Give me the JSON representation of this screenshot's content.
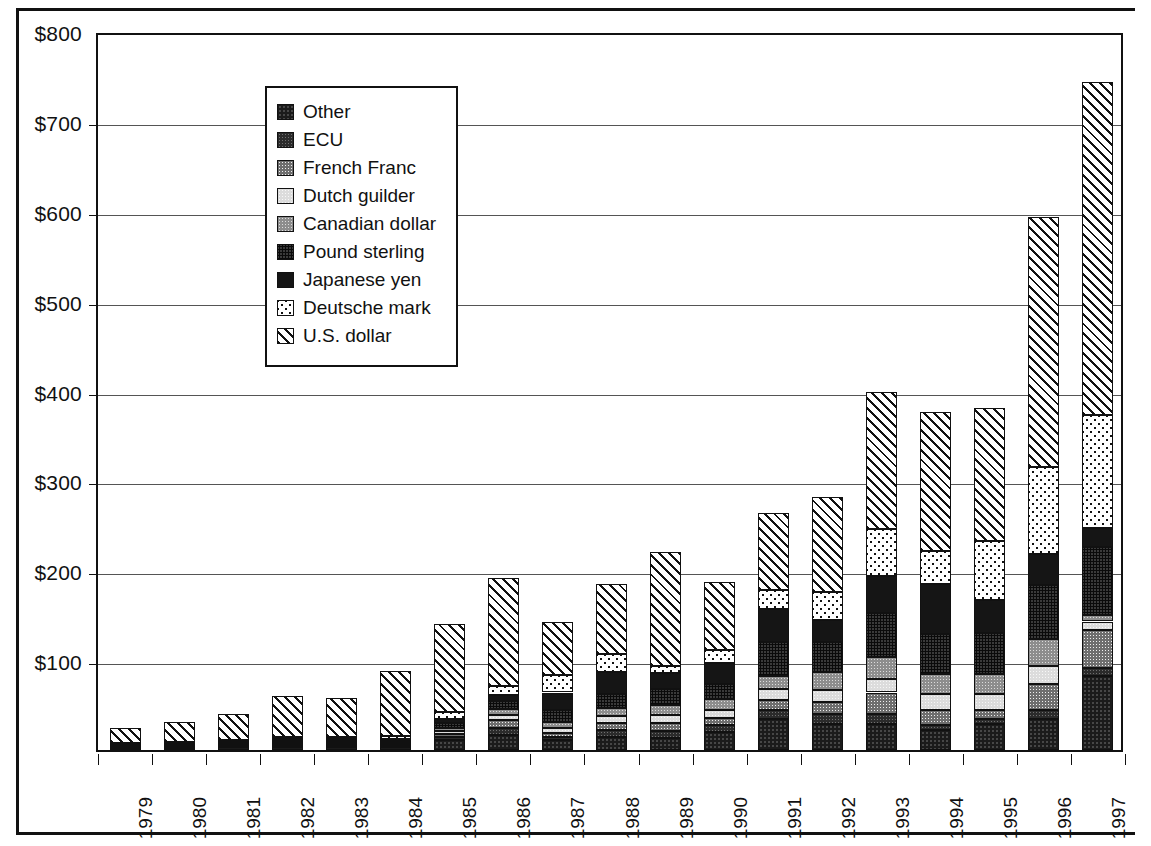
{
  "chart_data": {
    "type": "bar",
    "subtype": "stacked-vertical",
    "title": "",
    "xlabel": "",
    "ylabel": "U.S dollars (billions)",
    "ylim": [
      0,
      800
    ],
    "ytick_values": [
      100,
      200,
      300,
      400,
      500,
      600,
      700,
      800
    ],
    "ytick_labels": [
      "$100",
      "$200",
      "$300",
      "$400",
      "$500",
      "$600",
      "$700",
      "$800"
    ],
    "grid": true,
    "legend_position": "upper-left-inside",
    "categories": [
      "1979",
      "1980",
      "1981",
      "1982",
      "1983",
      "1984",
      "1985",
      "1986",
      "1987",
      "1988",
      "1989",
      "1990",
      "1991",
      "1992",
      "1993",
      "1994",
      "1995",
      "1996",
      "1997"
    ],
    "series": [
      {
        "name": "U.S. dollar",
        "key": "usd",
        "swatch": "white-diagonal-hatch",
        "values": [
          16,
          22,
          29,
          45,
          43,
          72,
          98,
          120,
          59,
          78,
          126,
          76,
          86,
          106,
          152,
          155,
          148,
          278,
          370
        ]
      },
      {
        "name": "Deutsche mark",
        "key": "dem",
        "swatch": "black-white-speckle",
        "values": [
          1,
          1,
          2,
          3,
          3,
          4,
          7,
          10,
          20,
          20,
          8,
          14,
          21,
          31,
          52,
          36,
          66,
          97,
          126
        ]
      },
      {
        "name": "Japanese yen",
        "key": "jpy",
        "swatch": "solid-black",
        "values": [
          1,
          1,
          1,
          2,
          2,
          2,
          5,
          7,
          20,
          25,
          18,
          24,
          37,
          25,
          41,
          56,
          37,
          34,
          21
        ]
      },
      {
        "name": "Pound sterling",
        "key": "gbp",
        "swatch": "dark-gray-dither",
        "values": [
          1,
          1,
          1,
          2,
          2,
          2,
          5,
          8,
          13,
          15,
          18,
          16,
          38,
          33,
          49,
          44,
          45,
          61,
          76
        ]
      },
      {
        "name": "Canadian dollar",
        "key": "cad",
        "swatch": "medium-gray",
        "values": [
          1,
          1,
          1,
          2,
          2,
          2,
          4,
          7,
          7,
          9,
          11,
          12,
          14,
          20,
          25,
          23,
          23,
          30,
          7
        ]
      },
      {
        "name": "Dutch guilder",
        "key": "nlg",
        "swatch": "light-gray",
        "values": [
          1,
          1,
          1,
          1,
          1,
          1,
          3,
          6,
          5,
          8,
          9,
          9,
          12,
          14,
          15,
          17,
          17,
          20,
          9
        ]
      },
      {
        "name": "French Franc",
        "key": "frf",
        "swatch": "medium-gray-dither",
        "values": [
          1,
          1,
          1,
          1,
          1,
          1,
          3,
          8,
          4,
          8,
          9,
          8,
          11,
          13,
          24,
          17,
          10,
          29,
          43
        ]
      },
      {
        "name": "ECU",
        "key": "ecu",
        "swatch": "dark-gray-fine-dither",
        "values": [
          1,
          1,
          1,
          1,
          1,
          1,
          4,
          8,
          4,
          8,
          8,
          8,
          10,
          11,
          11,
          6,
          6,
          9,
          9
        ]
      },
      {
        "name": "Other",
        "key": "oth",
        "swatch": "near-black-dither",
        "values": [
          1,
          2,
          3,
          3,
          3,
          3,
          11,
          17,
          11,
          14,
          13,
          20,
          35,
          29,
          29,
          22,
          29,
          35,
          82
        ]
      }
    ],
    "totals": [
      24,
      31,
      40,
      60,
      58,
      88,
      140,
      191,
      143,
      185,
      220,
      187,
      264,
      282,
      398,
      376,
      381,
      593,
      743
    ]
  },
  "legend": {
    "items": [
      {
        "label": "Other",
        "key": "oth"
      },
      {
        "label": "ECU",
        "key": "ecu"
      },
      {
        "label": "French Franc",
        "key": "frf"
      },
      {
        "label": "Dutch guilder",
        "key": "nlg"
      },
      {
        "label": "Canadian dollar",
        "key": "cad"
      },
      {
        "label": "Pound sterling",
        "key": "gbp"
      },
      {
        "label": "Japanese yen",
        "key": "jpy"
      },
      {
        "label": "Deutsche mark",
        "key": "dem"
      },
      {
        "label": "U.S. dollar",
        "key": "usd"
      }
    ]
  }
}
